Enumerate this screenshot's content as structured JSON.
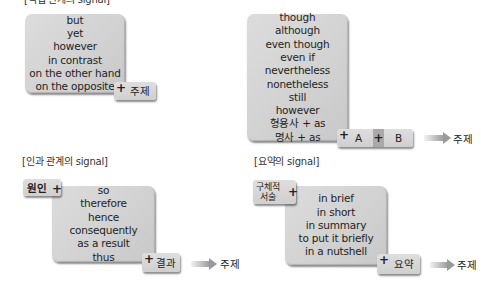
{
  "sections": {
    "contrast": {
      "label": "[역접 관계의 signal]",
      "words": [
        "but",
        "yet",
        "however",
        "in contrast",
        "on the other hand",
        "on the opposite"
      ],
      "tag": "주제"
    },
    "concession": {
      "words": [
        "though",
        "although",
        "even though",
        "even if",
        "nevertheless",
        "nonetheless",
        "still",
        "however",
        "형용사 + as",
        "명사 + as"
      ],
      "tag_a": "A",
      "tag_b": "B",
      "result": "주제"
    },
    "cause_effect": {
      "label": "[인과 관계의 signal]",
      "cause_tag": "원인",
      "words": [
        "so",
        "therefore",
        "hence",
        "consequently",
        "as a result",
        "thus"
      ],
      "effect_tag": "결과",
      "result": "주제"
    },
    "summary": {
      "label": "[요약의 signal]",
      "detail_tag_line1": "구체적",
      "detail_tag_line2": "서술",
      "words": [
        "in brief",
        "in short",
        "in summary",
        "to put it briefly",
        "in a nutshell"
      ],
      "summary_tag": "요약",
      "result": "주제"
    }
  },
  "symbols": {
    "plus": "+"
  }
}
